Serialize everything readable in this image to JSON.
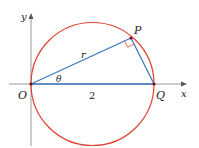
{
  "diagram": {
    "type": "geometry",
    "colors": {
      "circle": "#e0412f",
      "segments": "#3a78c2",
      "axes": "#9a9a9a",
      "points": "#7a1010",
      "text": "#222222"
    },
    "axes": {
      "x_label": "x",
      "y_label": "y"
    },
    "points": {
      "O": {
        "label": "O"
      },
      "P": {
        "label": "P"
      },
      "Q": {
        "label": "Q"
      }
    },
    "labels": {
      "radius": "r",
      "angle": "θ",
      "diameter_length": "2"
    }
  }
}
